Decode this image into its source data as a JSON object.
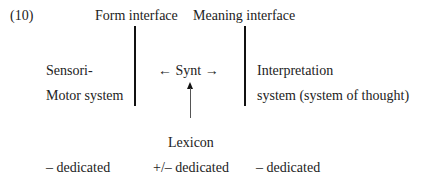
{
  "example_number": "(10)",
  "interfaces": {
    "form": "Form interface",
    "meaning": "Meaning interface"
  },
  "left_system": {
    "line1": "Sensori-",
    "line2": "Motor system"
  },
  "center": {
    "label": "← Synt →",
    "lexicon": "Lexicon"
  },
  "right_system": {
    "line1": "Interpretation",
    "line2": "system (system of thought)"
  },
  "dedication": {
    "left": "– dedicated",
    "center": "+/– dedicated",
    "right": "– dedicated"
  }
}
